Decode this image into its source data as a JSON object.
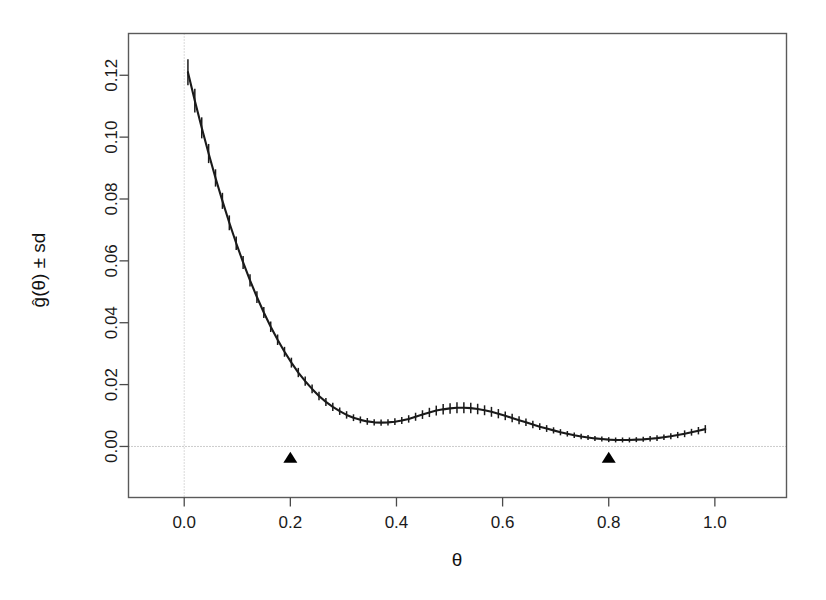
{
  "chart_data": {
    "type": "line",
    "title": "",
    "subtitle": "",
    "xlabel": "θ",
    "ylabel": "ĝ(θ) ± sd",
    "xlim": [
      -0.105,
      1.135
    ],
    "ylim": [
      -0.0165,
      0.1335
    ],
    "xticks": [
      0.0,
      0.2,
      0.4,
      0.6,
      0.8,
      1.0
    ],
    "xticklabels": [
      "0.0",
      "0.2",
      "0.4",
      "0.6",
      "0.8",
      "1.0"
    ],
    "yticks": [
      0.0,
      0.02,
      0.04,
      0.06,
      0.08,
      0.1,
      0.12
    ],
    "yticklabels": [
      "0.00",
      "0.02",
      "0.04",
      "0.06",
      "0.08",
      "0.10",
      "0.12"
    ],
    "grid": false,
    "legend": null,
    "reference_lines": [
      {
        "name": "h-zero",
        "orientation": "horizontal",
        "value": 0.0,
        "style": "dotted"
      },
      {
        "name": "v-zero",
        "orientation": "vertical",
        "value": 0.0,
        "style": "dotted"
      }
    ],
    "series": [
      {
        "name": "g-hat",
        "style": "line-with-errorbars",
        "color": "#1a1a1a",
        "errorbar_style": "vertical-tick",
        "x": [
          0.007,
          0.02,
          0.033,
          0.046,
          0.059,
          0.072,
          0.085,
          0.098,
          0.111,
          0.124,
          0.137,
          0.15,
          0.163,
          0.176,
          0.189,
          0.202,
          0.215,
          0.228,
          0.241,
          0.254,
          0.267,
          0.28,
          0.293,
          0.306,
          0.319,
          0.332,
          0.345,
          0.358,
          0.371,
          0.384,
          0.397,
          0.41,
          0.423,
          0.436,
          0.449,
          0.462,
          0.475,
          0.488,
          0.501,
          0.514,
          0.527,
          0.54,
          0.553,
          0.566,
          0.579,
          0.592,
          0.605,
          0.618,
          0.631,
          0.644,
          0.657,
          0.67,
          0.683,
          0.696,
          0.709,
          0.722,
          0.735,
          0.748,
          0.761,
          0.774,
          0.787,
          0.8,
          0.813,
          0.826,
          0.839,
          0.852,
          0.865,
          0.878,
          0.891,
          0.904,
          0.917,
          0.93,
          0.943,
          0.956,
          0.969,
          0.982
        ],
        "y": [
          0.121,
          0.1118,
          0.103,
          0.0947,
          0.0868,
          0.0794,
          0.0723,
          0.0657,
          0.0595,
          0.0537,
          0.0483,
          0.0433,
          0.0387,
          0.0345,
          0.0306,
          0.0271,
          0.0239,
          0.0211,
          0.0186,
          0.0163,
          0.0144,
          0.0128,
          0.0114,
          0.0102,
          0.0093,
          0.0086,
          0.0081,
          0.0078,
          0.0077,
          0.0078,
          0.008,
          0.0084,
          0.0089,
          0.0096,
          0.0103,
          0.011,
          0.0116,
          0.012,
          0.0123,
          0.0125,
          0.0125,
          0.0124,
          0.0121,
          0.0117,
          0.0112,
          0.0106,
          0.0099,
          0.0092,
          0.0085,
          0.0078,
          0.0071,
          0.0064,
          0.0058,
          0.0052,
          0.0046,
          0.0041,
          0.0036,
          0.0032,
          0.0029,
          0.0026,
          0.0024,
          0.0022,
          0.0021,
          0.0021,
          0.0021,
          0.0022,
          0.0023,
          0.0025,
          0.0027,
          0.003,
          0.0033,
          0.0037,
          0.0041,
          0.0046,
          0.0051,
          0.0056
        ],
        "sd": [
          0.0042,
          0.0038,
          0.0034,
          0.0031,
          0.0028,
          0.0026,
          0.0024,
          0.0022,
          0.0021,
          0.002,
          0.0019,
          0.0018,
          0.0017,
          0.0017,
          0.0016,
          0.0016,
          0.0015,
          0.0015,
          0.0014,
          0.0014,
          0.0013,
          0.0013,
          0.0012,
          0.0012,
          0.0011,
          0.0011,
          0.0011,
          0.001,
          0.001,
          0.001,
          0.0011,
          0.0011,
          0.0012,
          0.0013,
          0.0014,
          0.0015,
          0.0016,
          0.0017,
          0.0017,
          0.0018,
          0.0018,
          0.0017,
          0.0017,
          0.0016,
          0.0016,
          0.0015,
          0.0014,
          0.0014,
          0.0013,
          0.0012,
          0.0012,
          0.0011,
          0.0011,
          0.001,
          0.001,
          0.0009,
          0.0009,
          0.0009,
          0.0008,
          0.0008,
          0.0008,
          0.0008,
          0.0008,
          0.0008,
          0.0008,
          0.0008,
          0.0008,
          0.0009,
          0.0009,
          0.0009,
          0.001,
          0.001,
          0.0011,
          0.0011,
          0.0012,
          0.0013
        ]
      }
    ],
    "markers": [
      {
        "name": "knot-marker-1",
        "shape": "filled-triangle-up",
        "x": 0.2,
        "y": -0.0035,
        "color": "#000000"
      },
      {
        "name": "knot-marker-2",
        "shape": "filled-triangle-up",
        "x": 0.8,
        "y": -0.0035,
        "color": "#000000"
      }
    ]
  }
}
